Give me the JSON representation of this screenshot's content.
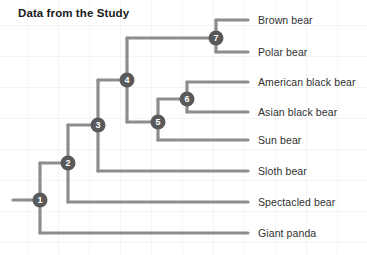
{
  "page": {
    "title": "Data from the Study",
    "ghost_top_text": "",
    "background_color": "#ffffff",
    "grid_color": "#e8ecf4"
  },
  "diagram": {
    "type": "cladogram",
    "line_color": "#8d8d8d",
    "node_fill": "#595959",
    "node_text_color": "#ffffff",
    "label_color": "#2f2f2f",
    "root_stub_x": 13,
    "leaf_line_end_x": 248,
    "label_x": 258,
    "leaves": [
      {
        "id": "brown-bear",
        "label": "Brown bear",
        "y": 20,
        "branch_x": 216
      },
      {
        "id": "polar-bear",
        "label": "Polar bear",
        "y": 52,
        "branch_x": 216
      },
      {
        "id": "american-black-bear",
        "label": "American black bear",
        "y": 82,
        "branch_x": 187
      },
      {
        "id": "asian-black-bear",
        "label": "Asian black bear",
        "y": 112,
        "branch_x": 187
      },
      {
        "id": "sun-bear",
        "label": "Sun bear",
        "y": 140,
        "branch_x": 158
      },
      {
        "id": "sloth-bear",
        "label": "Sloth bear",
        "y": 171,
        "branch_x": 98
      },
      {
        "id": "spectacled-bear",
        "label": "Spectacled bear",
        "y": 202,
        "branch_x": 68
      },
      {
        "id": "giant-panda",
        "label": "Giant panda",
        "y": 233,
        "branch_x": 40
      }
    ],
    "nodes": [
      {
        "number": "1",
        "x": 40,
        "y": 200,
        "child_top_y": 163,
        "child_bottom_y": 233
      },
      {
        "number": "2",
        "x": 68,
        "y": 163,
        "child_top_y": 125,
        "child_bottom_y": 202
      },
      {
        "number": "3",
        "x": 98,
        "y": 125,
        "child_top_y": 80,
        "child_bottom_y": 171
      },
      {
        "number": "4",
        "x": 127,
        "y": 80,
        "child_top_y": 38,
        "child_bottom_y": 122
      },
      {
        "number": "5",
        "x": 158,
        "y": 122,
        "child_top_y": 99,
        "child_bottom_y": 140
      },
      {
        "number": "6",
        "x": 187,
        "y": 99,
        "child_top_y": 82,
        "child_bottom_y": 112
      },
      {
        "number": "7",
        "x": 216,
        "y": 38,
        "child_top_y": 20,
        "child_bottom_y": 52
      }
    ]
  }
}
